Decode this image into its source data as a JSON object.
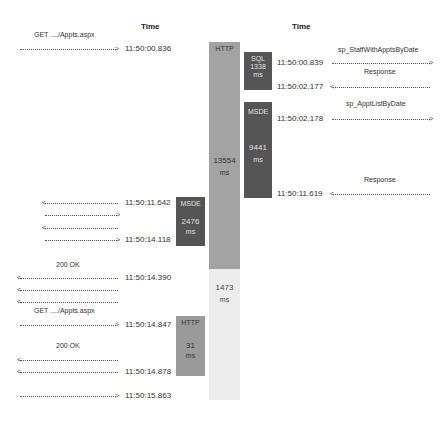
{
  "headers": {
    "left_time": "Time",
    "right_time": "Time"
  },
  "bars": {
    "http_main": {
      "label": "HTTP",
      "value": "13554",
      "unit": "ms",
      "color": "#a3a3a3"
    },
    "http_main_tail": {
      "value": "1473",
      "unit": "ms",
      "color": "#ececec"
    },
    "sql": {
      "label": "SQL",
      "value": "1338",
      "unit": "ms",
      "color": "#555555"
    },
    "msde_right": {
      "label": "MSDE",
      "value": "9441",
      "unit": "ms",
      "color": "#555555"
    },
    "msde_left": {
      "label": "MSDE",
      "value": "2476",
      "unit": "ms",
      "color": "#555555"
    },
    "http_small": {
      "label": "HTTP",
      "value": "31",
      "unit": "ms",
      "color": "#9a9a9a"
    }
  },
  "left_events": [
    {
      "label": "GET ..../Appts.aspx",
      "time": "11:50:00.836",
      "direction": "right"
    },
    {
      "label": "",
      "time": "11:50:11.642",
      "direction": "left"
    },
    {
      "label": "",
      "time": "",
      "direction": "right"
    },
    {
      "label": "",
      "time": "",
      "direction": "left"
    },
    {
      "label": "",
      "time": "11:50:14.118",
      "direction": "right"
    },
    {
      "label": "200 OK",
      "time": "11:50:14.390",
      "direction": "left"
    },
    {
      "label": "",
      "time": "",
      "direction": "left"
    },
    {
      "label": "",
      "time": "",
      "direction": "left"
    },
    {
      "label": "GET ..../Appts.aspx",
      "time": "11:50:14.847",
      "direction": "right"
    },
    {
      "label": "200 OK",
      "time": "",
      "direction": "left"
    },
    {
      "label": "",
      "time": "11:50:14.878",
      "direction": "left"
    },
    {
      "label": "",
      "time": "11:50:15.863",
      "direction": "right"
    }
  ],
  "right_events": [
    {
      "label": "sp_StaffWithApptsByDate",
      "time": "11:50:00.839",
      "direction": "right"
    },
    {
      "label": "Response",
      "time": "11:50:02.177",
      "direction": "left"
    },
    {
      "label": "sp_ApptListByDate",
      "time": "11:50:02.178",
      "direction": "right"
    },
    {
      "label": "Response",
      "time": "11:50:11.619",
      "direction": "left"
    }
  ],
  "arrowheads": {
    "right": ">",
    "left": "<"
  }
}
